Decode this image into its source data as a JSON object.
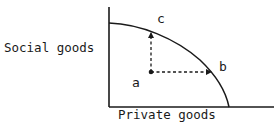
{
  "diagram": {
    "type": "production-possibility-frontier",
    "y_axis_label": "Social goods",
    "x_axis_label": "Private goods",
    "points": [
      {
        "id": "a",
        "label": "a",
        "description": "inside frontier"
      },
      {
        "id": "b",
        "label": "b",
        "description": "on frontier, more private goods"
      },
      {
        "id": "c",
        "label": "c",
        "description": "on frontier, more social goods"
      }
    ],
    "arrows": [
      {
        "from": "a",
        "to": "c",
        "direction": "up",
        "style": "dashed"
      },
      {
        "from": "a",
        "to": "b",
        "direction": "right",
        "style": "dashed"
      }
    ],
    "colors": {
      "line": "#1a1a1a",
      "background": "#ffffff"
    }
  }
}
